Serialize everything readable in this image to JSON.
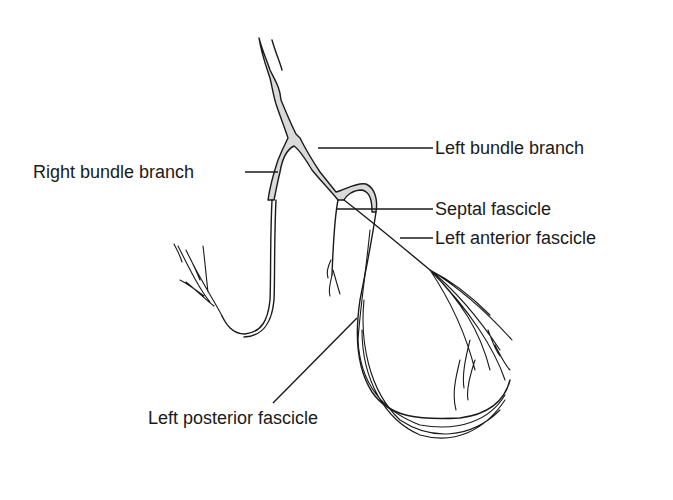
{
  "diagram": {
    "type": "anatomical-line-drawing",
    "labels": {
      "right_bundle_branch": "Right bundle branch",
      "left_bundle_branch": "Left bundle branch",
      "septal_fascicle": "Septal fascicle",
      "left_anterior_fascicle": "Left anterior fascicle",
      "left_posterior_fascicle": "Left posterior fascicle"
    },
    "colors": {
      "line": "#1a1a1a",
      "fill": "#d9d9d9",
      "background": "#ffffff"
    }
  }
}
